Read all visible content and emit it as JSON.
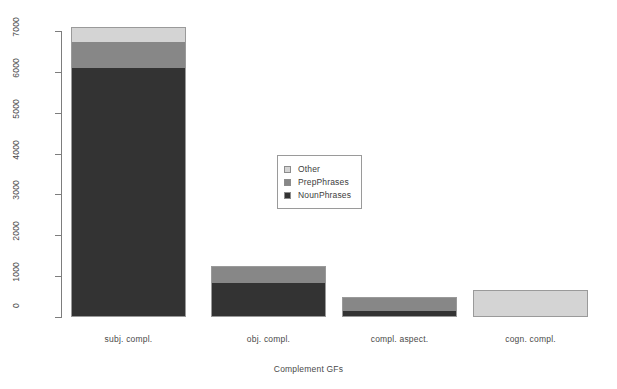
{
  "chart_data": {
    "type": "bar",
    "subtype": "stacked",
    "title": "",
    "xlabel": "Complement GFs",
    "ylabel": "",
    "categories": [
      "subj. compl.",
      "obj. compl.",
      "compl. aspect.",
      "cogn. compl."
    ],
    "series": [
      {
        "name": "NounPhrases",
        "color": "#333333",
        "values": [
          6100,
          830,
          150,
          0
        ]
      },
      {
        "name": "PrepPhrases",
        "color": "#878787",
        "values": [
          620,
          420,
          340,
          0
        ]
      },
      {
        "name": "Other",
        "color": "#d4d4d4",
        "values": [
          370,
          0,
          0,
          660
        ]
      }
    ],
    "stack_order_bottom_to_top": [
      "NounPhrases",
      "PrepPhrases",
      "Other"
    ],
    "totals": [
      7090,
      1250,
      490,
      660
    ],
    "ylim": [
      0,
      7000
    ],
    "ytick_labels": [
      "0",
      "1000",
      "2000",
      "3000",
      "4000",
      "5000",
      "6000",
      "7000"
    ],
    "ytick_values": [
      0,
      1000,
      2000,
      3000,
      4000,
      5000,
      6000,
      7000
    ],
    "grid": false,
    "legend_position": "center",
    "legend_entries": [
      "Other",
      "PrepPhrases",
      "NounPhrases"
    ]
  },
  "axis": {
    "x_title": "Complement GFs"
  },
  "legend": {
    "items": [
      {
        "label": "Other",
        "color": "#d4d4d4"
      },
      {
        "label": "PrepPhrases",
        "color": "#878787"
      },
      {
        "label": "NounPhrases",
        "color": "#333333"
      }
    ]
  }
}
